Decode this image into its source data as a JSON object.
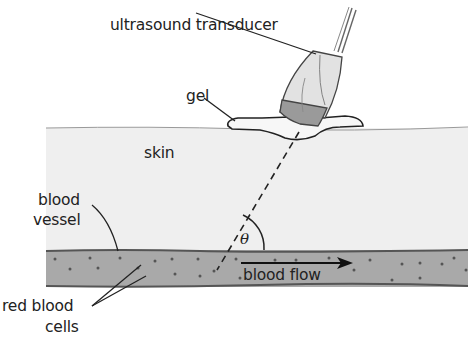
{
  "diagram": {
    "labels": {
      "transducer": "ultrasound transducer",
      "gel": "gel",
      "skin": "skin",
      "vessel_line1": "blood",
      "vessel_line2": "vessel",
      "cells_line1": "red blood",
      "cells_line2": "cells",
      "flow": "blood flow",
      "angle": "θ"
    },
    "colors": {
      "skin": "#efefef",
      "vessel": "#a9a9a9",
      "transducer_body": "#e2e2e2",
      "transducer_tip": "#9a9a9a",
      "gel": "#f7f7f7",
      "line": "#222222"
    }
  }
}
